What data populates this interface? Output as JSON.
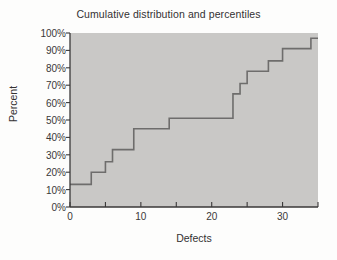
{
  "chart_data": {
    "type": "line",
    "subtype": "step-ecdf",
    "title": "Cumulative distribution and percentiles",
    "xlabel": "Defects",
    "ylabel": "Percent",
    "xlim": [
      0,
      35
    ],
    "ylim": [
      0,
      100
    ],
    "grid": false,
    "legend": null,
    "x_major_ticks": [
      0,
      10,
      20,
      30
    ],
    "x_minor_ticks": [
      5,
      15,
      25,
      35
    ],
    "x_tick_labels": [
      "0",
      "10",
      "20",
      "30"
    ],
    "y_ticks": [
      0,
      10,
      20,
      30,
      40,
      50,
      60,
      70,
      80,
      90,
      100
    ],
    "y_tick_labels": [
      "0%",
      "10%",
      "20%",
      "30%",
      "40%",
      "50%",
      "60%",
      "70%",
      "80%",
      "90%",
      "100%"
    ],
    "step_points": [
      {
        "x": 0,
        "y": 13
      },
      {
        "x": 3,
        "y": 13
      },
      {
        "x": 3,
        "y": 20
      },
      {
        "x": 5,
        "y": 20
      },
      {
        "x": 5,
        "y": 26
      },
      {
        "x": 6,
        "y": 26
      },
      {
        "x": 6,
        "y": 33
      },
      {
        "x": 9,
        "y": 33
      },
      {
        "x": 9,
        "y": 45
      },
      {
        "x": 14,
        "y": 45
      },
      {
        "x": 14,
        "y": 51
      },
      {
        "x": 23,
        "y": 51
      },
      {
        "x": 23,
        "y": 65
      },
      {
        "x": 24,
        "y": 65
      },
      {
        "x": 24,
        "y": 71
      },
      {
        "x": 25,
        "y": 71
      },
      {
        "x": 25,
        "y": 78
      },
      {
        "x": 28,
        "y": 78
      },
      {
        "x": 28,
        "y": 84
      },
      {
        "x": 30,
        "y": 84
      },
      {
        "x": 30,
        "y": 91
      },
      {
        "x": 34,
        "y": 91
      },
      {
        "x": 34,
        "y": 97
      },
      {
        "x": 35,
        "y": 97
      }
    ],
    "colors": {
      "plot_background": "#c9c8c6",
      "line": "#6e6d6c",
      "axis": "#3a3838",
      "text": "#333132",
      "page_background": "#fdfdfc"
    }
  }
}
